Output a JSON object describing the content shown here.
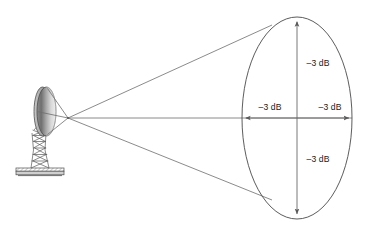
{
  "diagram": {
    "background_color": "#ffffff",
    "width": 366,
    "height": 225,
    "line_color": "#6d6d6d",
    "outline_color": "#4a4a4a",
    "text_color": "#1a1a1a"
  },
  "antenna": {
    "name": "parabolic-dish-antenna",
    "reflector": {
      "label": "dish-reflector",
      "fill_light": "#f2f2f2",
      "fill_mid": "#9a9a9a",
      "fill_dark": "#5f5f5f",
      "center_x": 45.5,
      "center_y": 111.5,
      "rx": 10.5,
      "ry": 24.5
    },
    "feed": {
      "label": "feed-horn",
      "focal_x": 68,
      "focal_y": 118
    },
    "mast": {
      "label": "lattice-tower-mount"
    },
    "base": {
      "label": "base-plate"
    }
  },
  "beam": {
    "name": "radiation-beam-cone",
    "apex_x": 68,
    "apex_y": 118,
    "upper_edge_x": 272,
    "upper_edge_y": 25,
    "lower_edge_x": 272,
    "lower_edge_y": 200,
    "axis_end_x": 352,
    "axis_end_y": 118
  },
  "footprint": {
    "name": "beam-footprint-ellipse",
    "center_x": 297,
    "center_y": 118,
    "rx": 55,
    "ry": 101
  },
  "labels": {
    "top": "–3 dB",
    "left": "–3 dB",
    "right": "–3 dB",
    "bottom": "–3 dB"
  },
  "label_positions": {
    "top": {
      "x": 318,
      "y": 66
    },
    "left": {
      "x": 266,
      "y": 110
    },
    "right": {
      "x": 328,
      "y": 110
    },
    "bottom": {
      "x": 318,
      "y": 162
    }
  }
}
